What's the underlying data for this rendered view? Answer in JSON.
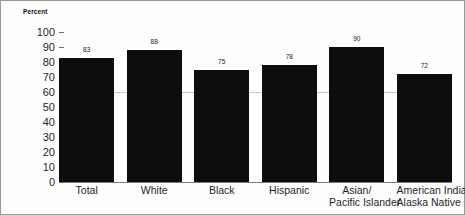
{
  "chart_data": {
    "type": "bar",
    "title": "",
    "xlabel": "",
    "ylabel": "Percent",
    "ylim": [
      0,
      100
    ],
    "ytick_step": 10,
    "yticks": [
      "100",
      "90",
      "80",
      "70",
      "60",
      "50",
      "40",
      "30",
      "20",
      "10",
      "0"
    ],
    "grid": false,
    "reference_line": 60,
    "bar_color": "#0d0d0d",
    "legend": null,
    "categories": [
      "Total",
      "White",
      "Black",
      "Hispanic",
      "Asian/ Pacific Islander",
      "American Indian/ Alaska Native"
    ],
    "category_lines": [
      [
        "Total"
      ],
      [
        "White"
      ],
      [
        "Black"
      ],
      [
        "Hispanic"
      ],
      [
        "Asian/",
        "Pacific Islander"
      ],
      [
        "American Indian/",
        "Alaska Native"
      ]
    ],
    "values": [
      83,
      88,
      75,
      78,
      90,
      72
    ],
    "value_labels": [
      "83",
      "88",
      "75",
      "78",
      "90",
      "72"
    ]
  }
}
